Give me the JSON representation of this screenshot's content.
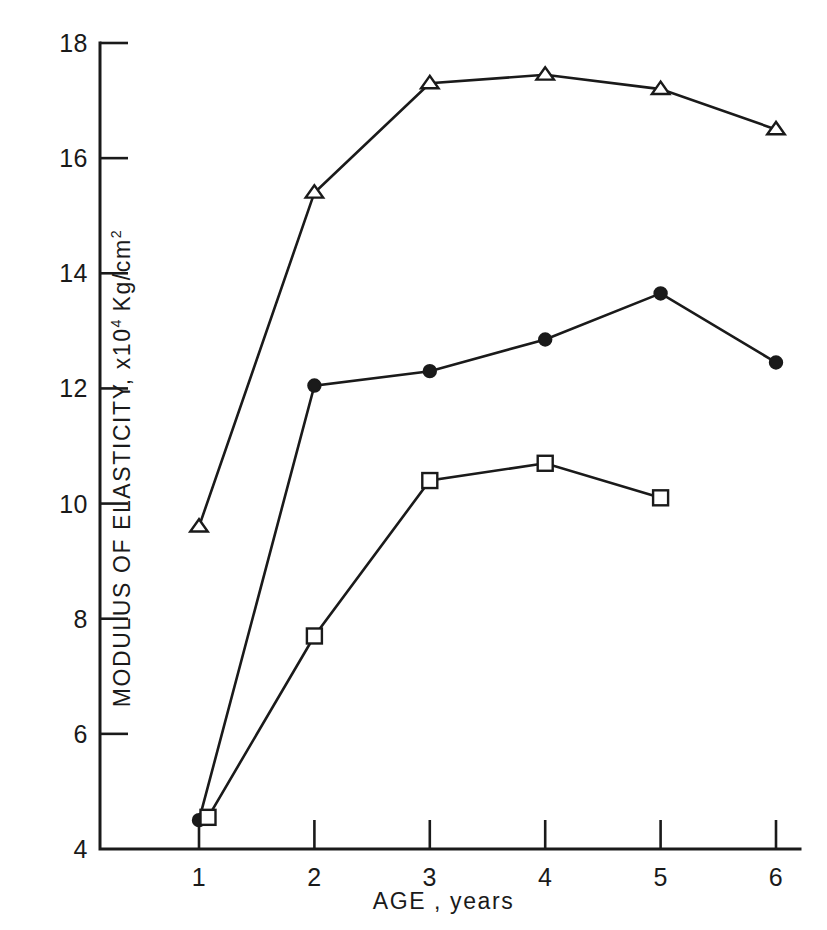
{
  "chart_data": {
    "type": "line",
    "title": "",
    "xlabel": "AGE , years",
    "ylabel_text": "MODULUS OF ELASTICITY,  x10",
    "ylabel_exp": "4",
    "ylabel_units": " Kg/cm",
    "ylabel_units_exp": "2",
    "x": [
      1,
      2,
      3,
      4,
      5,
      6
    ],
    "xlim": [
      0.6,
      6.3
    ],
    "ylim": [
      4,
      18
    ],
    "xticks": [
      "1",
      "2",
      "3",
      "4",
      "5",
      "6"
    ],
    "yticks": [
      "4",
      "6",
      "8",
      "10",
      "12",
      "14",
      "16",
      "18"
    ],
    "ytick_values": [
      4,
      6,
      8,
      10,
      12,
      14,
      16,
      18
    ],
    "grid": false,
    "legend": "none",
    "series": [
      {
        "name": "series-triangle",
        "marker": "open-triangle",
        "x": [
          1,
          2,
          3,
          4,
          5,
          6
        ],
        "values": [
          9.6,
          15.4,
          17.3,
          17.45,
          17.2,
          16.5
        ]
      },
      {
        "name": "series-filled-circle",
        "marker": "filled-circle",
        "x": [
          1,
          2,
          3,
          4,
          5,
          6
        ],
        "values": [
          4.5,
          12.05,
          12.3,
          12.85,
          13.65,
          12.45
        ]
      },
      {
        "name": "series-open-square",
        "marker": "open-square",
        "x": [
          1,
          2,
          3,
          4,
          5
        ],
        "values": [
          4.55,
          7.7,
          10.4,
          10.7,
          10.1
        ]
      }
    ],
    "colors": {
      "ink": "#1a1a1a",
      "background": "#ffffff"
    }
  }
}
